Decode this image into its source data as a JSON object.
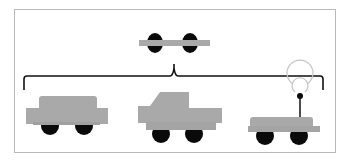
{
  "diagram": {
    "type": "hierarchy",
    "colors": {
      "body": "#a9a9a9",
      "wheel": "#0a0a0a",
      "bracket": "#111111",
      "frame": "#b8b8b8",
      "signal": "#bdbdbd"
    },
    "parent": {
      "id": "base-chassis",
      "label": "chassis with two wheels"
    },
    "children": [
      {
        "id": "car",
        "label": "car"
      },
      {
        "id": "pickup-truck",
        "label": "pickup truck"
      },
      {
        "id": "rc-vehicle",
        "label": "vehicle with antenna"
      }
    ]
  }
}
